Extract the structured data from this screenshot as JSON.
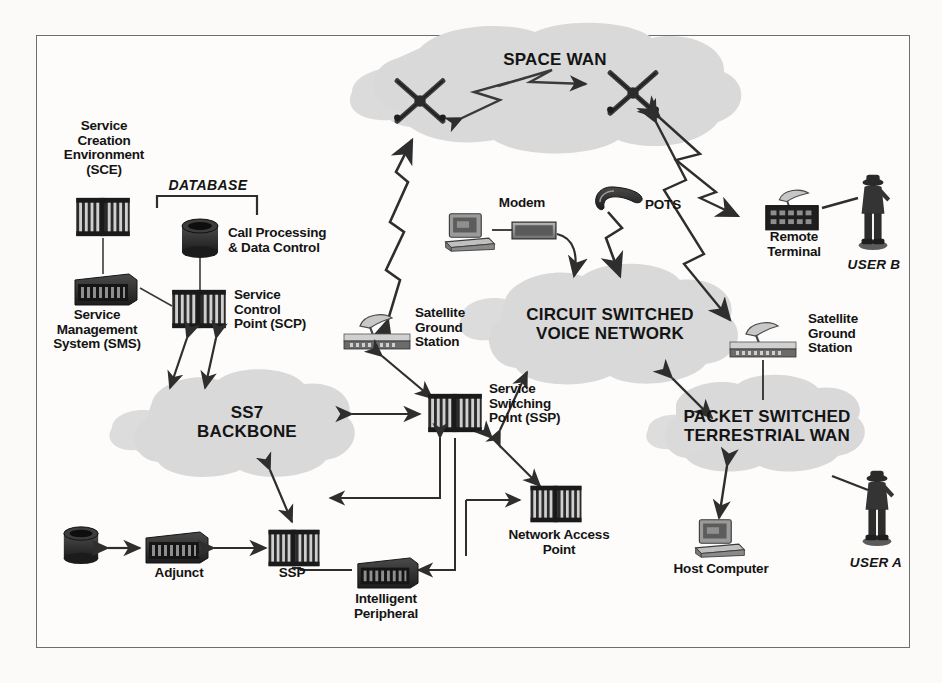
{
  "diagram": {
    "frame": {
      "border_color": "#6e6e6e",
      "background": "#fdfcfa"
    },
    "palette": {
      "cloud_fill": "#d9d9d9",
      "cloud_fill_light": "#e0e0e0",
      "device_dark": "#2a2a2a",
      "device_mid": "#585858",
      "device_light": "#9a9a9a",
      "line": "#3a3a3a",
      "text": "#141414",
      "background": "#fbfaf8"
    },
    "clouds": [
      {
        "id": "space-wan",
        "label": "SPACE WAN",
        "x": 555,
        "y": 60
      },
      {
        "id": "circuit-switched-voice-network",
        "label": "CIRCUIT SWITCHED\nVOICE NETWORK",
        "x": 610,
        "y": 322
      },
      {
        "id": "ss7-backbone",
        "label": "SS7\nBACKBONE",
        "x": 247,
        "y": 420
      },
      {
        "id": "packet-switched-terrestrial-wan",
        "label": "PACKET SWITCHED\nTERRESTRIAL WAN",
        "x": 767,
        "y": 425
      }
    ],
    "nodes": [
      {
        "id": "service-creation-environment",
        "label": "Service\nCreation\nEnvironment\n(SCE)",
        "icon": "switch-rack-icon",
        "x": 103,
        "y": 160
      },
      {
        "id": "database-bracket",
        "label": "DATABASE",
        "icon": "bracket-icon",
        "x": 208,
        "y": 196
      },
      {
        "id": "call-processing-data-control",
        "label": "Call Processing\n& Data Control",
        "icon": "disk-cylinder-icon",
        "x": 198,
        "y": 240
      },
      {
        "id": "service-management-system",
        "label": "Service\nManagement\nSystem (SMS)",
        "icon": "server-box-icon",
        "x": 97,
        "y": 280
      },
      {
        "id": "service-control-point",
        "label": "Service\nControl\nPoint (SCP)",
        "icon": "switch-rack-icon",
        "x": 190,
        "y": 307
      },
      {
        "id": "satellite-ground-station-left",
        "label": "Satellite\nGround\nStation",
        "icon": "satellite-dish-station-icon",
        "x": 372,
        "y": 330
      },
      {
        "id": "modem",
        "label": "Modem",
        "icon": "modem-box-icon",
        "x": 508,
        "y": 206
      },
      {
        "id": "workstation-pc",
        "label": "",
        "icon": "desktop-computer-icon",
        "x": 462,
        "y": 225
      },
      {
        "id": "pots-telephone",
        "label": "POTS",
        "icon": "telephone-handset-icon",
        "x": 619,
        "y": 205
      },
      {
        "id": "remote-terminal",
        "label": "Remote\nTerminal",
        "icon": "terminal-with-dish-icon",
        "x": 806,
        "y": 222
      },
      {
        "id": "user-b",
        "label": "USER B",
        "icon": "person-icon",
        "x": 875,
        "y": 225
      },
      {
        "id": "satellite-ground-station-right",
        "label": "Satellite\nGround\nStation",
        "icon": "satellite-dish-station-icon",
        "x": 770,
        "y": 338
      },
      {
        "id": "service-switching-point",
        "label": "Service\nSwitching\nPoint (SSP)",
        "icon": "switch-rack-icon",
        "x": 455,
        "y": 412
      },
      {
        "id": "network-access-point",
        "label": "Network Access\nPoint",
        "icon": "switch-rack-icon",
        "x": 556,
        "y": 508
      },
      {
        "id": "host-computer",
        "label": "Host Computer",
        "icon": "desktop-computer-icon",
        "x": 718,
        "y": 540
      },
      {
        "id": "user-a",
        "label": "USER A",
        "icon": "person-icon",
        "x": 878,
        "y": 530
      },
      {
        "id": "adjunct",
        "label": "Adjunct",
        "icon": "server-box-icon",
        "x": 175,
        "y": 547
      },
      {
        "id": "adjunct-disk",
        "label": "",
        "icon": "disk-cylinder-icon",
        "x": 81,
        "y": 545
      },
      {
        "id": "ssp-bottom",
        "label": "SSP",
        "icon": "switch-rack-icon",
        "x": 293,
        "y": 548
      },
      {
        "id": "intelligent-peripheral",
        "label": "Intelligent\nPeripheral",
        "icon": "server-box-icon",
        "x": 386,
        "y": 592
      },
      {
        "id": "satellite-left",
        "label": "",
        "icon": "satellite-icon",
        "x": 418,
        "y": 105
      },
      {
        "id": "satellite-right",
        "label": "",
        "icon": "satellite-icon",
        "x": 632,
        "y": 97
      }
    ],
    "links": [
      {
        "from": "satellite-left",
        "to": "satellite-right",
        "style": "rf-zigzag",
        "arrows": "both"
      },
      {
        "from": "satellite-ground-station-left",
        "to": "satellite-left",
        "style": "rf-zigzag",
        "arrows": "both"
      },
      {
        "from": "satellite-right",
        "to": "remote-terminal",
        "style": "rf-zigzag",
        "arrows": "both"
      },
      {
        "from": "satellite-right",
        "to": "satellite-ground-station-right",
        "style": "rf-zigzag",
        "arrows": "both"
      },
      {
        "from": "service-creation-environment",
        "to": "service-management-system",
        "style": "plain",
        "arrows": "none"
      },
      {
        "from": "service-management-system",
        "to": "service-control-point",
        "style": "plain",
        "arrows": "none"
      },
      {
        "from": "call-processing-data-control",
        "to": "service-control-point",
        "style": "plain",
        "arrows": "none"
      },
      {
        "from": "service-control-point",
        "to": "ss7-backbone",
        "style": "plain",
        "arrows": "both"
      },
      {
        "from": "ss7-backbone",
        "to": "service-switching-point",
        "style": "plain",
        "arrows": "both"
      },
      {
        "from": "ss7-backbone",
        "to": "ssp-bottom",
        "style": "plain",
        "arrows": "both"
      },
      {
        "from": "satellite-ground-station-left",
        "to": "service-switching-point",
        "style": "plain",
        "arrows": "both"
      },
      {
        "from": "service-switching-point",
        "to": "circuit-switched-voice-network",
        "style": "plain",
        "arrows": "both"
      },
      {
        "from": "service-switching-point",
        "to": "network-access-point",
        "style": "plain",
        "arrows": "both"
      },
      {
        "from": "modem",
        "to": "circuit-switched-voice-network",
        "style": "curve",
        "arrows": "end"
      },
      {
        "from": "pots-telephone",
        "to": "circuit-switched-voice-network",
        "style": "plain",
        "arrows": "end"
      },
      {
        "from": "circuit-switched-voice-network",
        "to": "packet-switched-terrestrial-wan",
        "style": "plain",
        "arrows": "both"
      },
      {
        "from": "satellite-ground-station-right",
        "to": "packet-switched-terrestrial-wan",
        "style": "plain",
        "arrows": "none"
      },
      {
        "from": "packet-switched-terrestrial-wan",
        "to": "host-computer",
        "style": "plain",
        "arrows": "both"
      },
      {
        "from": "packet-switched-terrestrial-wan",
        "to": "user-a",
        "style": "plain",
        "arrows": "none"
      },
      {
        "from": "remote-terminal",
        "to": "user-b",
        "style": "plain",
        "arrows": "none"
      },
      {
        "from": "adjunct-disk",
        "to": "adjunct",
        "style": "plain",
        "arrows": "both"
      },
      {
        "from": "adjunct",
        "to": "ssp-bottom",
        "style": "plain",
        "arrows": "both"
      },
      {
        "from": "ssp-bottom",
        "to": "service-switching-point",
        "style": "ortho",
        "arrows": "both"
      },
      {
        "from": "intelligent-peripheral",
        "to": "service-switching-point",
        "style": "ortho",
        "arrows": "both"
      },
      {
        "from": "intelligent-peripheral",
        "to": "network-access-point",
        "style": "ortho",
        "arrows": "end"
      }
    ]
  }
}
